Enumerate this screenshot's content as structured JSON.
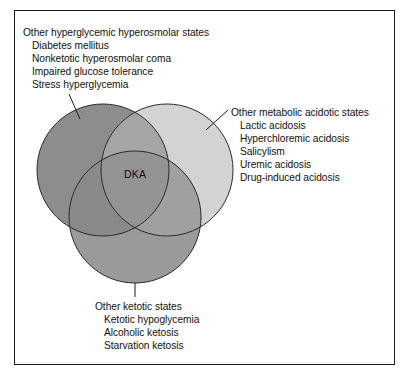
{
  "diagram": {
    "type": "venn",
    "center_label": "DKA",
    "frame_border_color": "#1a1a1a",
    "background": "#ffffff",
    "circles": [
      {
        "id": "hyperglycemic",
        "name": "Other hyperglycemic hyperosmolar states",
        "fill": "#8d8d8d",
        "stroke": "#2b2b2b",
        "cx": 103,
        "cy": 170,
        "r": 66
      },
      {
        "id": "acidotic",
        "name": "Other metabolic acidotic states",
        "fill": "#d3d3d3",
        "stroke": "#2b2b2b",
        "cx": 167,
        "cy": 170,
        "r": 66
      },
      {
        "id": "ketotic",
        "name": "Other ketotic states",
        "fill": "#9a9a9a",
        "stroke": "#2b2b2b",
        "cx": 135,
        "cy": 217,
        "r": 66
      }
    ],
    "blocks": [
      {
        "id": "hyperglycemic",
        "heading": "Other hyperglycemic hyperosmolar states",
        "items": [
          "Diabetes mellitus",
          "Nonketotic hyperosmolar coma",
          "Impaired glucose tolerance",
          "Stress hyperglycemia"
        ]
      },
      {
        "id": "acidotic",
        "heading": "Other metabolic acidotic states",
        "items": [
          "Lactic acidosis",
          "Hyperchloremic acidosis",
          "Salicylism",
          "Uremic acidosis",
          "Drug-induced acidosis"
        ]
      },
      {
        "id": "ketotic",
        "heading": "Other ketotic states",
        "items": [
          "Ketotic hypoglycemia",
          "Alcoholic ketosis",
          "Starvation ketosis"
        ]
      }
    ]
  }
}
